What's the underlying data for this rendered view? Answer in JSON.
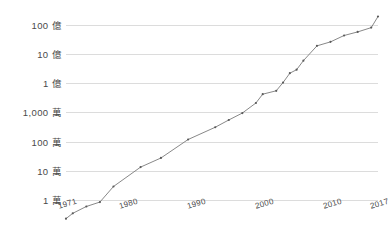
{
  "chart_data": {
    "type": "line",
    "title": "",
    "subtitle": "",
    "xlabel": "",
    "ylabel": "",
    "yscale": "log",
    "grid": true,
    "legend": null,
    "xlim": [
      1971,
      2017
    ],
    "ylim": [
      10000,
      20000000000
    ],
    "y_ticks": [
      10000,
      100000,
      1000000,
      10000000,
      100000000,
      1000000000,
      10000000000
    ],
    "y_tick_labels": [
      "1 萬",
      "10 萬",
      "100 萬",
      "1,000 萬",
      "1 億",
      "10 億",
      "100 億"
    ],
    "x_ticks": [
      1971,
      1980,
      1990,
      2000,
      2010,
      2017
    ],
    "x_tick_labels": [
      "1971",
      "1980",
      "1990",
      "2000",
      "2010",
      "2017"
    ],
    "series": [
      {
        "name": "transistor-count",
        "color": "#7b7b7b",
        "points": [
          {
            "x": 1971,
            "y": 2300
          },
          {
            "x": 1972,
            "y": 3500
          },
          {
            "x": 1974,
            "y": 6000
          },
          {
            "x": 1976,
            "y": 8500
          },
          {
            "x": 1978,
            "y": 29000
          },
          {
            "x": 1982,
            "y": 134000
          },
          {
            "x": 1985,
            "y": 275000
          },
          {
            "x": 1989,
            "y": 1180000
          },
          {
            "x": 1993,
            "y": 3100000
          },
          {
            "x": 1995,
            "y": 5500000
          },
          {
            "x": 1997,
            "y": 9500000
          },
          {
            "x": 1999,
            "y": 21000000
          },
          {
            "x": 2000,
            "y": 42000000
          },
          {
            "x": 2002,
            "y": 55000000
          },
          {
            "x": 2003,
            "y": 105000000
          },
          {
            "x": 2004,
            "y": 220000000
          },
          {
            "x": 2005,
            "y": 290000000
          },
          {
            "x": 2006,
            "y": 590000000
          },
          {
            "x": 2008,
            "y": 1900000000
          },
          {
            "x": 2010,
            "y": 2600000000
          },
          {
            "x": 2012,
            "y": 4300000000
          },
          {
            "x": 2014,
            "y": 5700000000
          },
          {
            "x": 2016,
            "y": 8000000000
          },
          {
            "x": 2017,
            "y": 19200000000
          }
        ]
      }
    ],
    "colors": {
      "line": "#7b7b7b",
      "marker": "#5a5a5a",
      "gridline": "#dcdcdc",
      "tick_text": "#4a4a4a",
      "background": "#ffffff"
    }
  }
}
